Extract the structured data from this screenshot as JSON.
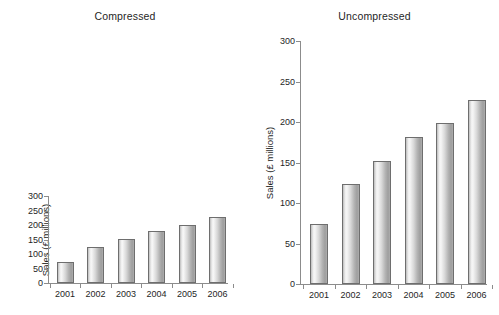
{
  "chart_data": [
    {
      "type": "bar",
      "title": "Compressed",
      "xlabel": "",
      "ylabel": "Sales (£ millions)",
      "categories": [
        "2001",
        "2002",
        "2003",
        "2004",
        "2005",
        "2006"
      ],
      "values": [
        74,
        123,
        152,
        181,
        199,
        227
      ],
      "ylim": [
        0,
        300
      ],
      "yticks": [
        0,
        50,
        100,
        150,
        200,
        250,
        300
      ],
      "ytick_labels": [
        "0",
        "50",
        "100",
        "150",
        "200",
        "250",
        "300"
      ],
      "grid": false,
      "legend": "none",
      "note": "Vertically compressed aspect ratio; identical data to the Uncompressed panel"
    },
    {
      "type": "bar",
      "title": "Uncompressed",
      "xlabel": "",
      "ylabel": "Sales (£ millions)",
      "categories": [
        "2001",
        "2002",
        "2003",
        "2004",
        "2005",
        "2006"
      ],
      "values": [
        74,
        123,
        152,
        181,
        199,
        227
      ],
      "ylim": [
        0,
        300
      ],
      "yticks": [
        0,
        50,
        100,
        150,
        200,
        250,
        300
      ],
      "ytick_labels": [
        "0",
        "50",
        "100",
        "150",
        "200",
        "250",
        "300"
      ],
      "grid": false,
      "legend": "none",
      "note": "Tall aspect ratio; identical data to the Compressed panel"
    }
  ],
  "figure": {
    "background": "#ffffff",
    "axis_color": "#8c8c8c",
    "bar_edge_color": "#6e6e6e",
    "bar_fill_light": "#f6f6f6",
    "bar_fill_dark": "#9e9e9e",
    "text_color": "#1f1f1f"
  },
  "panels": [
    {
      "key": "compressed",
      "title": "Compressed",
      "ylabel": "Sales (£ millions)",
      "ytick_labels": [
        "0",
        "50",
        "100",
        "150",
        "200",
        "250",
        "300"
      ],
      "xtick_labels": [
        "2001",
        "2002",
        "2003",
        "2004",
        "2005",
        "2006"
      ]
    },
    {
      "key": "uncompressed",
      "title": "Uncompressed",
      "ylabel": "Sales (£ millions)",
      "ytick_labels": [
        "0",
        "50",
        "100",
        "150",
        "200",
        "250",
        "300"
      ],
      "xtick_labels": [
        "2001",
        "2002",
        "2003",
        "2004",
        "2005",
        "2006"
      ]
    }
  ]
}
